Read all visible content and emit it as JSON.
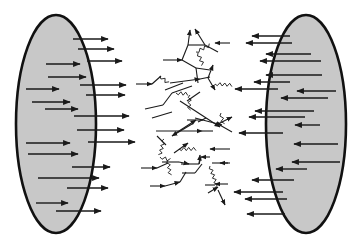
{
  "diagram": {
    "title": "",
    "colors": {
      "nucleus_fill": "#c8c8c8",
      "stroke": "#111111",
      "background": "#ffffff"
    },
    "left_nucleus": {
      "cx": 56,
      "cy": 124,
      "rx": 40,
      "ry": 109,
      "arrows_direction": "right",
      "arrows": [
        {
          "x1": 73,
          "y1": 39,
          "x2": 108,
          "y2": 39
        },
        {
          "x1": 78,
          "y1": 49,
          "x2": 114,
          "y2": 49
        },
        {
          "x1": 87,
          "y1": 61,
          "x2": 122,
          "y2": 61
        },
        {
          "x1": 46,
          "y1": 64,
          "x2": 80,
          "y2": 64
        },
        {
          "x1": 48,
          "y1": 77,
          "x2": 86,
          "y2": 77
        },
        {
          "x1": 80,
          "y1": 85,
          "x2": 126,
          "y2": 85
        },
        {
          "x1": 26,
          "y1": 89,
          "x2": 59,
          "y2": 89
        },
        {
          "x1": 86,
          "y1": 95,
          "x2": 125,
          "y2": 95
        },
        {
          "x1": 32,
          "y1": 102,
          "x2": 70,
          "y2": 102
        },
        {
          "x1": 45,
          "y1": 109,
          "x2": 78,
          "y2": 109
        },
        {
          "x1": 74,
          "y1": 116,
          "x2": 129,
          "y2": 116
        },
        {
          "x1": 77,
          "y1": 130,
          "x2": 124,
          "y2": 130
        },
        {
          "x1": 88,
          "y1": 142,
          "x2": 135,
          "y2": 142
        },
        {
          "x1": 26,
          "y1": 143,
          "x2": 70,
          "y2": 143
        },
        {
          "x1": 28,
          "y1": 154,
          "x2": 78,
          "y2": 154
        },
        {
          "x1": 72,
          "y1": 167,
          "x2": 110,
          "y2": 167
        },
        {
          "x1": 38,
          "y1": 178,
          "x2": 99,
          "y2": 178
        },
        {
          "x1": 67,
          "y1": 188,
          "x2": 108,
          "y2": 188
        },
        {
          "x1": 36,
          "y1": 203,
          "x2": 68,
          "y2": 203
        },
        {
          "x1": 56,
          "y1": 211,
          "x2": 101,
          "y2": 211
        }
      ]
    },
    "right_nucleus": {
      "cx": 306,
      "cy": 124,
      "rx": 40,
      "ry": 109,
      "arrows_direction": "left",
      "arrows": [
        {
          "x1": 290,
          "y1": 36,
          "x2": 252,
          "y2": 36
        },
        {
          "x1": 292,
          "y1": 43,
          "x2": 246,
          "y2": 43
        },
        {
          "x1": 311,
          "y1": 54,
          "x2": 266,
          "y2": 54
        },
        {
          "x1": 321,
          "y1": 61,
          "x2": 260,
          "y2": 61
        },
        {
          "x1": 322,
          "y1": 75,
          "x2": 266,
          "y2": 75
        },
        {
          "x1": 290,
          "y1": 82,
          "x2": 254,
          "y2": 82
        },
        {
          "x1": 278,
          "y1": 89,
          "x2": 235,
          "y2": 89
        },
        {
          "x1": 336,
          "y1": 91,
          "x2": 297,
          "y2": 91
        },
        {
          "x1": 328,
          "y1": 98,
          "x2": 281,
          "y2": 98
        },
        {
          "x1": 314,
          "y1": 111,
          "x2": 255,
          "y2": 111
        },
        {
          "x1": 305,
          "y1": 117,
          "x2": 249,
          "y2": 117
        },
        {
          "x1": 320,
          "y1": 125,
          "x2": 295,
          "y2": 125
        },
        {
          "x1": 283,
          "y1": 133,
          "x2": 239,
          "y2": 133
        },
        {
          "x1": 338,
          "y1": 144,
          "x2": 294,
          "y2": 144
        },
        {
          "x1": 340,
          "y1": 162,
          "x2": 292,
          "y2": 162
        },
        {
          "x1": 307,
          "y1": 169,
          "x2": 276,
          "y2": 169
        },
        {
          "x1": 294,
          "y1": 180,
          "x2": 252,
          "y2": 180
        },
        {
          "x1": 283,
          "y1": 192,
          "x2": 234,
          "y2": 192
        },
        {
          "x1": 287,
          "y1": 199,
          "x2": 245,
          "y2": 199
        },
        {
          "x1": 285,
          "y1": 214,
          "x2": 247,
          "y2": 214
        }
      ]
    },
    "shower": {
      "lines": [
        {
          "x1": 163,
          "y1": 60,
          "x2": 182,
          "y2": 60,
          "arrow": true
        },
        {
          "x1": 182,
          "y1": 60,
          "x2": 188,
          "y2": 45,
          "arrow": false
        },
        {
          "x1": 188,
          "y1": 45,
          "x2": 190,
          "y2": 30,
          "arrow": true
        },
        {
          "x1": 188,
          "y1": 45,
          "x2": 205,
          "y2": 45,
          "arrow": false
        },
        {
          "x1": 205,
          "y1": 45,
          "x2": 195,
          "y2": 29,
          "arrow": true
        },
        {
          "x1": 205,
          "y1": 45,
          "x2": 218,
          "y2": 52,
          "arrow": false
        },
        {
          "x1": 230,
          "y1": 43,
          "x2": 215,
          "y2": 43,
          "arrow": true
        },
        {
          "x1": 182,
          "y1": 60,
          "x2": 196,
          "y2": 68,
          "arrow": false
        },
        {
          "x1": 196,
          "y1": 68,
          "x2": 210,
          "y2": 70,
          "arrow": false
        },
        {
          "x1": 196,
          "y1": 68,
          "x2": 198,
          "y2": 83,
          "arrow": false
        },
        {
          "x1": 136,
          "y1": 84,
          "x2": 152,
          "y2": 84,
          "arrow": true
        },
        {
          "x1": 152,
          "y1": 84,
          "x2": 161,
          "y2": 76,
          "arrow": false
        },
        {
          "x1": 170,
          "y1": 83,
          "x2": 200,
          "y2": 79,
          "arrow": true
        },
        {
          "x1": 200,
          "y1": 79,
          "x2": 210,
          "y2": 77,
          "arrow": false
        },
        {
          "x1": 208,
          "y1": 78,
          "x2": 213,
          "y2": 65,
          "arrow": true
        },
        {
          "x1": 208,
          "y1": 78,
          "x2": 215,
          "y2": 90,
          "arrow": true
        },
        {
          "x1": 165,
          "y1": 90,
          "x2": 183,
          "y2": 83,
          "arrow": false
        },
        {
          "x1": 163,
          "y1": 105,
          "x2": 172,
          "y2": 93,
          "arrow": false
        },
        {
          "x1": 145,
          "y1": 109,
          "x2": 163,
          "y2": 105,
          "arrow": false
        },
        {
          "x1": 172,
          "y1": 93,
          "x2": 192,
          "y2": 86,
          "arrow": false
        },
        {
          "x1": 180,
          "y1": 101,
          "x2": 220,
          "y2": 127,
          "arrow": true
        },
        {
          "x1": 187,
          "y1": 101,
          "x2": 200,
          "y2": 92,
          "arrow": false
        },
        {
          "x1": 152,
          "y1": 118,
          "x2": 172,
          "y2": 112,
          "arrow": false
        },
        {
          "x1": 195,
          "y1": 118,
          "x2": 222,
          "y2": 125,
          "arrow": true
        },
        {
          "x1": 218,
          "y1": 124,
          "x2": 232,
          "y2": 117,
          "arrow": true
        },
        {
          "x1": 218,
          "y1": 124,
          "x2": 232,
          "y2": 132,
          "arrow": false
        },
        {
          "x1": 156,
          "y1": 131,
          "x2": 202,
          "y2": 131,
          "arrow": true
        },
        {
          "x1": 202,
          "y1": 131,
          "x2": 213,
          "y2": 131,
          "arrow": false
        },
        {
          "x1": 176,
          "y1": 133,
          "x2": 196,
          "y2": 120,
          "arrow": true
        },
        {
          "x1": 198,
          "y1": 122,
          "x2": 206,
          "y2": 118,
          "arrow": false
        },
        {
          "x1": 187,
          "y1": 120,
          "x2": 203,
          "y2": 120,
          "arrow": false
        },
        {
          "x1": 192,
          "y1": 124,
          "x2": 172,
          "y2": 136,
          "arrow": true
        },
        {
          "x1": 157,
          "y1": 136,
          "x2": 166,
          "y2": 145,
          "arrow": false
        },
        {
          "x1": 174,
          "y1": 153,
          "x2": 188,
          "y2": 143,
          "arrow": true
        },
        {
          "x1": 210,
          "y1": 157,
          "x2": 201,
          "y2": 157,
          "arrow": true
        },
        {
          "x1": 201,
          "y1": 157,
          "x2": 199,
          "y2": 164,
          "arrow": false
        },
        {
          "x1": 199,
          "y1": 164,
          "x2": 181,
          "y2": 164,
          "arrow": false
        },
        {
          "x1": 199,
          "y1": 164,
          "x2": 200,
          "y2": 155,
          "arrow": true
        },
        {
          "x1": 162,
          "y1": 162,
          "x2": 179,
          "y2": 162,
          "arrow": false
        },
        {
          "x1": 179,
          "y1": 162,
          "x2": 189,
          "y2": 164,
          "arrow": true
        },
        {
          "x1": 141,
          "y1": 168,
          "x2": 157,
          "y2": 168,
          "arrow": true
        },
        {
          "x1": 157,
          "y1": 168,
          "x2": 168,
          "y2": 163,
          "arrow": false
        },
        {
          "x1": 182,
          "y1": 173,
          "x2": 195,
          "y2": 173,
          "arrow": false
        },
        {
          "x1": 195,
          "y1": 173,
          "x2": 202,
          "y2": 164,
          "arrow": false
        },
        {
          "x1": 212,
          "y1": 163,
          "x2": 228,
          "y2": 163,
          "arrow": false
        },
        {
          "x1": 230,
          "y1": 163,
          "x2": 220,
          "y2": 163,
          "arrow": true
        },
        {
          "x1": 230,
          "y1": 149,
          "x2": 210,
          "y2": 149,
          "arrow": true
        },
        {
          "x1": 205,
          "y1": 185,
          "x2": 215,
          "y2": 185,
          "arrow": false
        },
        {
          "x1": 228,
          "y1": 184,
          "x2": 215,
          "y2": 184,
          "arrow": true
        },
        {
          "x1": 150,
          "y1": 186,
          "x2": 165,
          "y2": 186,
          "arrow": true
        },
        {
          "x1": 165,
          "y1": 186,
          "x2": 180,
          "y2": 182,
          "arrow": true
        },
        {
          "x1": 180,
          "y1": 182,
          "x2": 186,
          "y2": 172,
          "arrow": false
        },
        {
          "x1": 208,
          "y1": 193,
          "x2": 218,
          "y2": 187,
          "arrow": true
        },
        {
          "x1": 218,
          "y1": 190,
          "x2": 225,
          "y2": 205,
          "arrow": true
        }
      ],
      "gluons": [
        {
          "x1": 196,
          "y1": 52,
          "x2": 210,
          "y2": 45
        },
        {
          "x1": 198,
          "y1": 53,
          "x2": 203,
          "y2": 65
        },
        {
          "x1": 160,
          "y1": 76,
          "x2": 168,
          "y2": 83
        },
        {
          "x1": 215,
          "y1": 84,
          "x2": 232,
          "y2": 85
        },
        {
          "x1": 176,
          "y1": 93,
          "x2": 188,
          "y2": 94
        },
        {
          "x1": 190,
          "y1": 95,
          "x2": 189,
          "y2": 110
        },
        {
          "x1": 221,
          "y1": 113,
          "x2": 223,
          "y2": 124
        },
        {
          "x1": 164,
          "y1": 139,
          "x2": 160,
          "y2": 155
        },
        {
          "x1": 179,
          "y1": 149,
          "x2": 196,
          "y2": 149
        },
        {
          "x1": 160,
          "y1": 157,
          "x2": 170,
          "y2": 160
        },
        {
          "x1": 168,
          "y1": 160,
          "x2": 170,
          "y2": 175
        },
        {
          "x1": 210,
          "y1": 166,
          "x2": 217,
          "y2": 187
        }
      ]
    }
  }
}
